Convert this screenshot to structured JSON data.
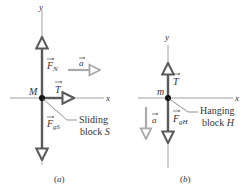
{
  "diagram_a": {
    "caption": "(a)",
    "axis_x": "x",
    "axis_y": "y",
    "mass_label": "M",
    "vectors": {
      "normal": {
        "symbol": "F",
        "subscript": "N"
      },
      "tension": {
        "symbol": "T"
      },
      "gravity": {
        "symbol": "F",
        "subscript": "gS"
      },
      "acceleration": {
        "symbol": "a"
      }
    },
    "callout_line1": "Sliding",
    "callout_line2_prefix": "block ",
    "callout_line2_var": "S"
  },
  "diagram_b": {
    "caption": "(b)",
    "axis_x": "x",
    "axis_y": "y",
    "mass_label": "m",
    "vectors": {
      "tension": {
        "symbol": "T"
      },
      "gravity": {
        "symbol": "F",
        "subscript": "gH"
      },
      "acceleration": {
        "symbol": "a"
      }
    },
    "callout_line1": "Hanging",
    "callout_line2_prefix": "block ",
    "callout_line2_var": "H"
  },
  "colors": {
    "axis": "#666666",
    "force_vector": "#5a5a5a",
    "accel_vector": "#aaaaaa",
    "text": "#333333"
  }
}
